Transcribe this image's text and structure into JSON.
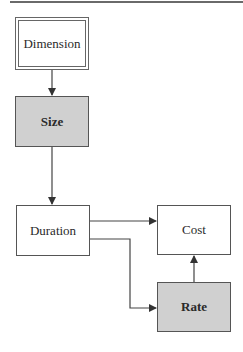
{
  "diagram": {
    "type": "flowchart",
    "nodes": [
      {
        "id": "dimension",
        "label": "Dimension",
        "style": "double-border"
      },
      {
        "id": "size",
        "label": "Size",
        "style": "shaded"
      },
      {
        "id": "duration",
        "label": "Duration",
        "style": "plain"
      },
      {
        "id": "cost",
        "label": "Cost",
        "style": "plain"
      },
      {
        "id": "rate",
        "label": "Rate",
        "style": "shaded"
      }
    ],
    "edges": [
      {
        "from": "dimension",
        "to": "size"
      },
      {
        "from": "size",
        "to": "duration"
      },
      {
        "from": "duration",
        "to": "cost"
      },
      {
        "from": "duration",
        "to": "rate"
      },
      {
        "from": "rate",
        "to": "cost"
      }
    ],
    "colors": {
      "shaded_fill": "#d0d0d0",
      "line": "#555555"
    }
  }
}
